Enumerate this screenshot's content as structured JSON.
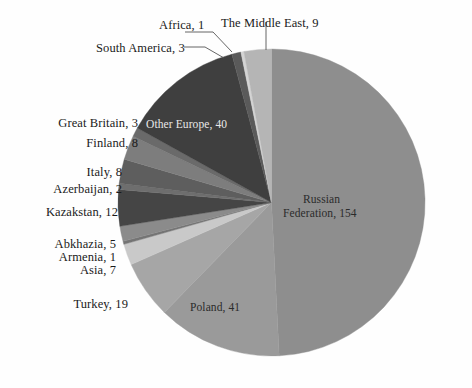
{
  "chart_data": {
    "type": "pie",
    "title": "",
    "total": 313,
    "start_angle_deg": 0,
    "direction": "clockwise",
    "legend": "none",
    "labels_position": "callout-and-inside",
    "categories": [
      "Russian Federation",
      "Poland",
      "Turkey",
      "Asia",
      "Armenia",
      "Abkhazia",
      "Kazakstan",
      "Azerbaijan",
      "Italy",
      "Finland",
      "Great Britain",
      "Other Europe",
      "South America",
      "Africa",
      "The Middle East"
    ],
    "values": [
      154,
      41,
      19,
      7,
      1,
      5,
      12,
      2,
      8,
      8,
      3,
      40,
      3,
      1,
      9
    ],
    "slices": [
      {
        "name": "Russian Federation",
        "value": 154,
        "label": "Russian Federation, 154",
        "color": "#8e8e8e"
      },
      {
        "name": "Poland",
        "value": 41,
        "label": "Poland, 41",
        "color": "#9a9a9a"
      },
      {
        "name": "Turkey",
        "value": 19,
        "label": "Turkey, 19",
        "color": "#a6a6a6"
      },
      {
        "name": "Asia",
        "value": 7,
        "label": "Asia, 7",
        "color": "#c9c9c9"
      },
      {
        "name": "Armenia",
        "value": 1,
        "label": "Armenia, 1",
        "color": "#747474"
      },
      {
        "name": "Abkhazia",
        "value": 5,
        "label": "Abkhazia, 5",
        "color": "#8b8b8b"
      },
      {
        "name": "Kazakstan",
        "value": 12,
        "label": "Kazakstan, 12",
        "color": "#454545"
      },
      {
        "name": "Azerbaijan",
        "value": 2,
        "label": "Azerbaijan, 2",
        "color": "#6e6e6e"
      },
      {
        "name": "Italy",
        "value": 8,
        "label": "Italy, 8",
        "color": "#5e5e5e"
      },
      {
        "name": "Finland",
        "value": 8,
        "label": "Finland, 8",
        "color": "#7d7d7d"
      },
      {
        "name": "Great Britain",
        "value": 3,
        "label": "Great Britain, 3",
        "color": "#6a6a6a"
      },
      {
        "name": "Other Europe",
        "value": 40,
        "label": "Other Europe, 40",
        "color": "#3f3f3f"
      },
      {
        "name": "South America",
        "value": 3,
        "label": "South America, 3",
        "color": "#5a5a5a"
      },
      {
        "name": "Africa",
        "value": 1,
        "label": "Africa, 1",
        "color": "#d4d4d4"
      },
      {
        "name": "The Middle East",
        "value": 9,
        "label": "The Middle East, 9",
        "color": "#b5b5b5"
      }
    ]
  },
  "callouts": {
    "africa": "Africa, 1",
    "middle_east": "The Middle East, 9",
    "south_america": "South America, 3",
    "great_britain": "Great Britain, 3",
    "finland": "Finland, 8",
    "italy": "Italy, 8",
    "azerbaijan": "Azerbaijan, 2",
    "kazakstan": "Kazakstan, 12",
    "abkhazia": "Abkhazia, 5",
    "armenia": "Armenia, 1",
    "asia": "Asia, 7",
    "turkey": "Turkey, 19"
  },
  "inner_labels": {
    "other_europe": "Other Europe, 40",
    "russian_federation_line1": "Russian",
    "russian_federation_line2": "Federation, 154",
    "poland": "Poland, 41"
  },
  "colors": {
    "background": "#fefefe",
    "text": "#1a1a1a",
    "leader_line": "#555555"
  }
}
